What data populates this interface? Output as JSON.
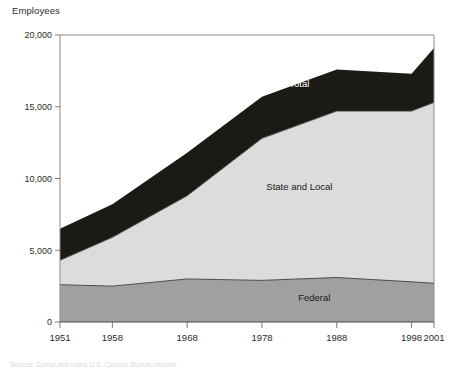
{
  "chart_data": {
    "type": "area",
    "title": "",
    "subtitle": "",
    "ylabel": "Employees",
    "xlabel": "",
    "x": [
      1951,
      1958,
      1968,
      1978,
      1988,
      1998,
      2001
    ],
    "xtick_labels": [
      "1951",
      "1958",
      "1968",
      "1978",
      "1988",
      "1998",
      "2001"
    ],
    "ytick_labels": [
      "0",
      "5,000",
      "10,000",
      "15,000",
      "20,000"
    ],
    "yticks": [
      0,
      5000,
      10000,
      15000,
      20000
    ],
    "ylim": [
      0,
      20000
    ],
    "xlim": [
      1951,
      2001
    ],
    "grid": false,
    "legend_position": "inline-annotations",
    "stacked": true,
    "series": [
      {
        "name": "Federal",
        "label": "Federal",
        "color": "#a0a0a0",
        "values": [
          2600,
          2500,
          3000,
          2900,
          3100,
          2800,
          2700
        ]
      },
      {
        "name": "State and Local",
        "label": "State and Local",
        "color": "#dcdcdc",
        "values": [
          1700,
          3400,
          5800,
          9900,
          11600,
          11900,
          12600
        ]
      },
      {
        "name": "Total band",
        "label": "Total",
        "color": "#1c1a15",
        "values": [
          2200,
          2300,
          3000,
          2900,
          2900,
          2600,
          3800
        ]
      }
    ],
    "cumulative": {
      "federal_top": [
        2600,
        2500,
        3000,
        2900,
        3100,
        2800,
        2700
      ],
      "state_local_top": [
        4300,
        5900,
        8800,
        12800,
        14700,
        14700,
        15300
      ],
      "total_top": [
        6500,
        8200,
        11800,
        15700,
        17600,
        17300,
        19100
      ]
    },
    "annotations": [
      {
        "text": "Total",
        "x": 1983,
        "y": 16400
      },
      {
        "text": "State and Local",
        "x": 1983,
        "y": 9200
      },
      {
        "text": "Federal",
        "x": 1985,
        "y": 1450
      }
    ],
    "colors": {
      "federal": "#a0a0a0",
      "state_and_local": "#dcdcdc",
      "total": "#1c1a15",
      "axis": "#7a7a7a",
      "text": "#2b2b2b"
    }
  },
  "footnote": {
    "text": "Source: Computed using U.S. Census Bureau reports"
  }
}
